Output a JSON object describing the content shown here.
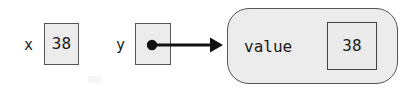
{
  "diagram": {
    "type": "reference-assignment",
    "canvas": {
      "width": 410,
      "height": 93,
      "background": "#ffffff"
    },
    "colors": {
      "box_fill": "#ececec",
      "box_border": "#555555",
      "text": "#1a1a1a",
      "arrow": "#111111",
      "bubble_fill": "#ececec",
      "bubble_border": "#555555"
    },
    "variables": [
      {
        "name": "x",
        "label": "x",
        "box_kind": "value-box",
        "value": "38",
        "holds": "value"
      },
      {
        "name": "y",
        "label": "y",
        "box_kind": "reference-box",
        "value": "",
        "holds": "reference"
      }
    ],
    "object": {
      "name": "value-object",
      "shape": "rounded-rectangle",
      "fields": [
        {
          "label": "value",
          "value": "38"
        }
      ]
    },
    "arrow": {
      "name": "reference-arrow",
      "from": "y",
      "to": "value-object",
      "style": "solid-with-dot-tail-and-arrowhead"
    }
  }
}
